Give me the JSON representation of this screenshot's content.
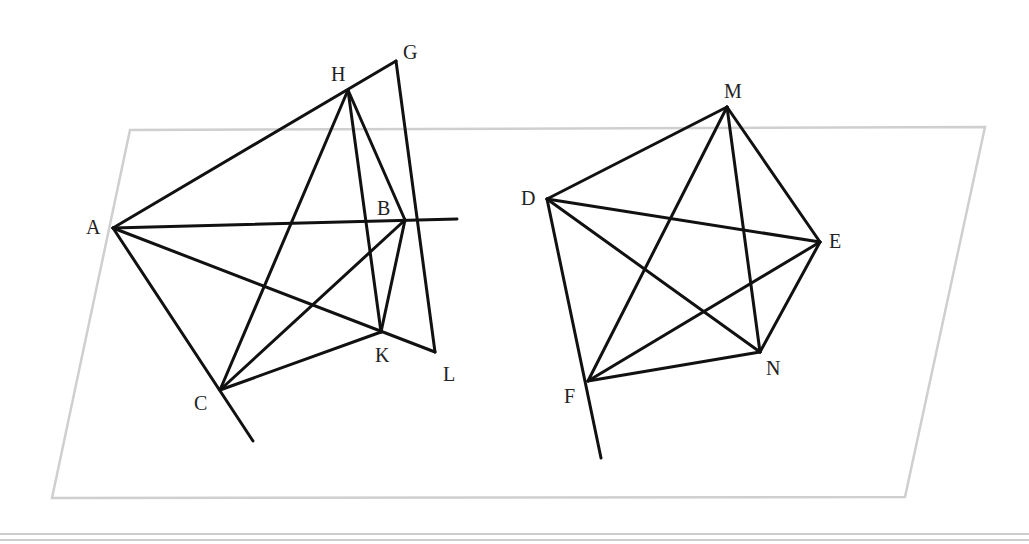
{
  "chart_data": {
    "type": "diagram",
    "title": "",
    "plane": {
      "corners": [
        [
          130,
          130
        ],
        [
          985,
          127
        ],
        [
          905,
          497
        ],
        [
          52,
          498
        ]
      ],
      "color": "#cfcfcf"
    },
    "figures": [
      {
        "name": "left-figure",
        "points": {
          "A": {
            "x": 113,
            "y": 228,
            "label": "A",
            "lx": 86,
            "ly": 234
          },
          "H": {
            "x": 348,
            "y": 90,
            "label": "H",
            "lx": 331,
            "ly": 81
          },
          "G": {
            "x": 396,
            "y": 61,
            "label": "G",
            "lx": 403,
            "ly": 59
          },
          "B": {
            "x": 405,
            "y": 220,
            "label": "B",
            "lx": 377,
            "ly": 215
          },
          "K": {
            "x": 381,
            "y": 332,
            "label": "K",
            "lx": 375,
            "ly": 362
          },
          "L": {
            "x": 435,
            "y": 352,
            "label": "L",
            "lx": 443,
            "ly": 381
          },
          "C": {
            "x": 220,
            "y": 390,
            "label": "C",
            "lx": 194,
            "ly": 410
          }
        },
        "segments": [
          [
            [
              113,
              228
            ],
            [
              396,
              61
            ]
          ],
          [
            [
              396,
              61
            ],
            [
              435,
              352
            ]
          ],
          [
            [
              435,
              352
            ],
            [
              113,
              228
            ]
          ],
          [
            [
              113,
              228
            ],
            [
              457,
              219
            ]
          ],
          [
            [
              113,
              228
            ],
            [
              253,
              441
            ]
          ],
          [
            [
              348,
              90
            ],
            [
              220,
              390
            ]
          ],
          [
            [
              348,
              90
            ],
            [
              381,
              332
            ]
          ],
          [
            [
              348,
              90
            ],
            [
              405,
              220
            ]
          ],
          [
            [
              405,
              220
            ],
            [
              381,
              332
            ]
          ],
          [
            [
              405,
              220
            ],
            [
              220,
              390
            ]
          ],
          [
            [
              381,
              332
            ],
            [
              220,
              390
            ]
          ]
        ]
      },
      {
        "name": "right-figure",
        "points": {
          "D": {
            "x": 547,
            "y": 199,
            "label": "D",
            "lx": 521,
            "ly": 205
          },
          "M": {
            "x": 727,
            "y": 107,
            "label": "M",
            "lx": 724,
            "ly": 98
          },
          "E": {
            "x": 820,
            "y": 242,
            "label": "E",
            "lx": 829,
            "ly": 248
          },
          "N": {
            "x": 760,
            "y": 352,
            "label": "N",
            "lx": 766,
            "ly": 375
          },
          "F": {
            "x": 588,
            "y": 381,
            "label": "F",
            "lx": 564,
            "ly": 403
          }
        },
        "segments": [
          [
            [
              547,
              199
            ],
            [
              727,
              107
            ]
          ],
          [
            [
              727,
              107
            ],
            [
              820,
              242
            ]
          ],
          [
            [
              820,
              242
            ],
            [
              760,
              352
            ]
          ],
          [
            [
              760,
              352
            ],
            [
              588,
              381
            ]
          ],
          [
            [
              547,
              199
            ],
            [
              601,
              458
            ]
          ],
          [
            [
              547,
              199
            ],
            [
              820,
              242
            ]
          ],
          [
            [
              547,
              199
            ],
            [
              760,
              352
            ]
          ],
          [
            [
              727,
              107
            ],
            [
              588,
              381
            ]
          ],
          [
            [
              727,
              107
            ],
            [
              760,
              352
            ]
          ],
          [
            [
              820,
              242
            ],
            [
              588,
              381
            ]
          ]
        ]
      }
    ],
    "rules": [
      {
        "x1": 0,
        "y1": 534,
        "x2": 1029,
        "y2": 534
      },
      {
        "x1": 0,
        "y1": 540,
        "x2": 1029,
        "y2": 540
      }
    ]
  }
}
